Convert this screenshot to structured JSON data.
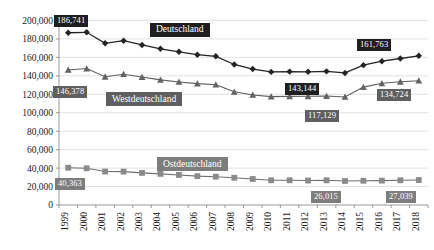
{
  "chart_data": {
    "type": "line",
    "title": "",
    "xlabel": "",
    "ylabel": "",
    "grid": true,
    "legend_position": "inline-labels",
    "ylim": [
      0,
      200000
    ],
    "ytick_step": 20000,
    "ytick_labels": [
      "0",
      "20,000",
      "40,000",
      "60,000",
      "80,000",
      "100,000",
      "120,000",
      "140,000",
      "160,000",
      "180,000",
      "200,000"
    ],
    "categories": [
      "1999",
      "2000",
      "2001",
      "2002",
      "2003",
      "2004",
      "2005",
      "2006",
      "2007",
      "2008",
      "2009",
      "2010",
      "2011",
      "2012",
      "2013",
      "2014",
      "2015",
      "2016",
      "2017",
      "2018"
    ],
    "series": [
      {
        "name": "Deutschland",
        "color": "#232323",
        "marker": "diamond",
        "values": [
          186741,
          187200,
          175300,
          178100,
          173500,
          169300,
          166100,
          162900,
          161200,
          152300,
          147400,
          144300,
          144600,
          144400,
          144900,
          143144,
          151600,
          155900,
          158800,
          161763
        ]
      },
      {
        "name": "Westdeutschland",
        "color": "#636363",
        "marker": "triangle",
        "values": [
          146378,
          147900,
          139000,
          141800,
          138700,
          135600,
          133400,
          131600,
          130400,
          122700,
          119300,
          117500,
          117800,
          117900,
          118100,
          117129,
          127800,
          131900,
          133600,
          134724
        ]
      },
      {
        "name": "Ostdeutschland",
        "color": "#8a8a8a",
        "marker": "square",
        "values": [
          40363,
          39800,
          36300,
          36200,
          34800,
          33700,
          32600,
          31300,
          30700,
          29500,
          28200,
          26800,
          26800,
          26500,
          26800,
          26015,
          26300,
          26400,
          26800,
          27039
        ]
      }
    ],
    "data_labels": [
      {
        "series": "Deutschland",
        "category": "1999",
        "text": "186,741",
        "style": "dark"
      },
      {
        "series": "Deutschland",
        "category": "2014",
        "text": "143,144",
        "style": "dark"
      },
      {
        "series": "Deutschland",
        "category": "2018",
        "text": "161,763",
        "style": "dark"
      },
      {
        "series": "Westdeutschland",
        "category": "1999",
        "text": "146,378",
        "style": "mid"
      },
      {
        "series": "Westdeutschland",
        "category": "2014",
        "text": "117,129",
        "style": "mid"
      },
      {
        "series": "Westdeutschland",
        "category": "2018",
        "text": "134,724",
        "style": "mid"
      },
      {
        "series": "Ostdeutschland",
        "category": "1999",
        "text": "40,363",
        "style": "gray"
      },
      {
        "series": "Ostdeutschland",
        "category": "2014",
        "text": "26,015",
        "style": "gray"
      },
      {
        "series": "Ostdeutschland",
        "category": "2018",
        "text": "27,039",
        "style": "gray"
      }
    ],
    "series_labels": [
      {
        "text": "Deutschland",
        "style": "dark"
      },
      {
        "text": "Westdeutschland",
        "style": "mid"
      },
      {
        "text": "Ostdeutschland",
        "style": "gray"
      }
    ]
  }
}
